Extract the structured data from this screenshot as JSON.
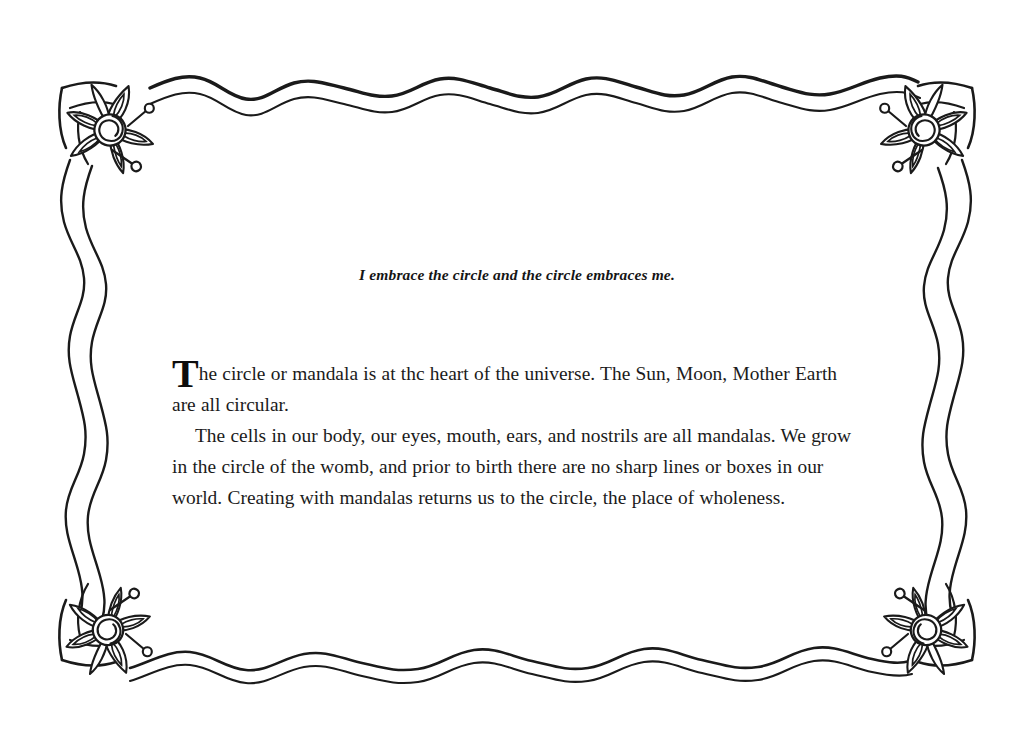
{
  "page": {
    "background_color": "#ffffff",
    "ink_color": "#1b1b1b",
    "width": 1034,
    "height": 748
  },
  "epigraph": {
    "text": "I embrace the circle and the circle embraces me."
  },
  "body": {
    "dropcap": "T",
    "paragraph_1_rest": "he circle or mandala is at thc heart of the universe. The Sun, Moon, Mother Earth are all circular.",
    "paragraph_2": "The cells in our body, our eyes, mouth, ears, and nostrils are all mandalas. We grow in the circle of the womb, and prior to birth there are no sharp lines or boxes in our world. Creating with mandalas returns us to the circle, the place of wholeness."
  },
  "ornaments": {
    "border_style": "double-wavy-line",
    "corner_motif": "spiral-center-flower",
    "corner_count": 4,
    "corners": [
      "top-left-flower",
      "top-right-flower",
      "bottom-left-flower",
      "bottom-right-flower"
    ],
    "stroke_color": "#1a1a1a"
  }
}
